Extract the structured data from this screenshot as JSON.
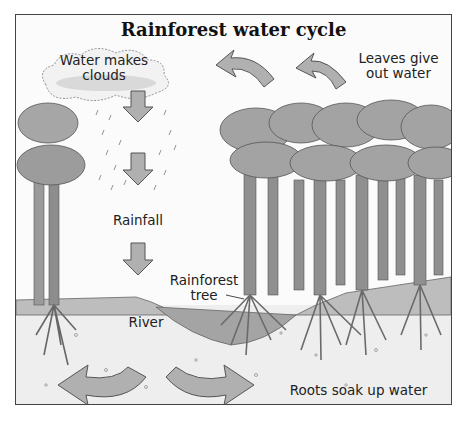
{
  "title": "Rainforest water cycle",
  "labels": {
    "clouds": "Water makes clouds",
    "leaves_line1": "Leaves give",
    "leaves_line2": "out water",
    "clouds_line1": "Water makes",
    "clouds_line2": "clouds",
    "rainfall": "Rainfall",
    "tree_line1": "Rainforest",
    "tree_line2": "tree",
    "river": "River",
    "roots": "Roots soak up water"
  },
  "colors": {
    "arrow_fill": "#b0b0b0",
    "arrow_stroke": "#555555",
    "trunk": "#8a8a8a",
    "canopy": "#9c9c9c",
    "soil": "#ececec",
    "river": "#a8a8a8"
  }
}
